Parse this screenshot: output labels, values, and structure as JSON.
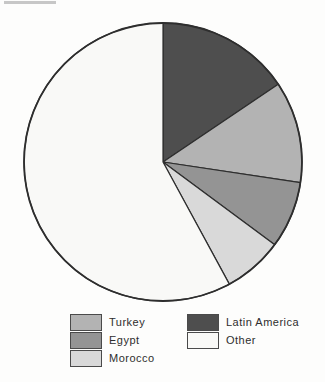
{
  "chart_data": {
    "type": "pie",
    "title": "",
    "clockwise_from": "top",
    "legend_position": "bottom",
    "outline_color": "#2e2e2e",
    "background_color": "#fdfdfc",
    "slices": [
      {
        "label": "Latin America",
        "percent": 15.6,
        "start_deg": 0,
        "end_deg": 56,
        "color": "#4e4e4e"
      },
      {
        "label": "Turkey",
        "percent": 11.8,
        "start_deg": 56,
        "end_deg": 98.5,
        "color": "#b3b3b3"
      },
      {
        "label": "Egypt",
        "percent": 7.8,
        "start_deg": 98.5,
        "end_deg": 126.5,
        "color": "#949494"
      },
      {
        "label": "Morocco",
        "percent": 6.9,
        "start_deg": 126.5,
        "end_deg": 151.5,
        "color": "#d9d9d9"
      },
      {
        "label": "Other",
        "percent": 57.9,
        "start_deg": 151.5,
        "end_deg": 360,
        "color": "#f9f9f7"
      }
    ]
  },
  "legend": {
    "columns": [
      {
        "items": [
          {
            "label": "Turkey",
            "color": "#b3b3b3"
          },
          {
            "label": "Egypt",
            "color": "#949494"
          },
          {
            "label": "Morocco",
            "color": "#d9d9d9"
          }
        ]
      },
      {
        "items": [
          {
            "label": "Latin America",
            "color": "#4e4e4e"
          },
          {
            "label": "Other",
            "color": "#f9f9f7"
          }
        ]
      }
    ]
  }
}
